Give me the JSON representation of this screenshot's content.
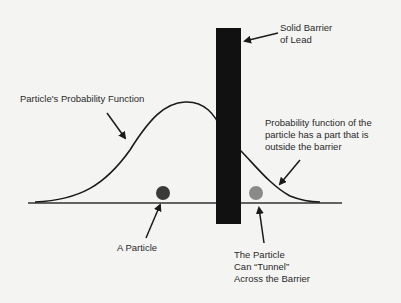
{
  "labels": {
    "barrier_line1": "Solid Barrier",
    "barrier_line2": "of Lead",
    "probability_function": "Particle's Probability Function",
    "outside_line1": "Probability function of the",
    "outside_line2": "particle has a part that is",
    "outside_line3": "outside the barrier",
    "particle": "A Particle",
    "tunnel_line1": "The Particle",
    "tunnel_line2": "Can “Tunnel”",
    "tunnel_line3": "Across the Barrier"
  },
  "colors": {
    "background": "#f4f4f2",
    "barrier": "#111111",
    "line": "#1a1a1a",
    "particle": "#3a3a3a",
    "tunneled_particle": "#8a8a8a"
  }
}
